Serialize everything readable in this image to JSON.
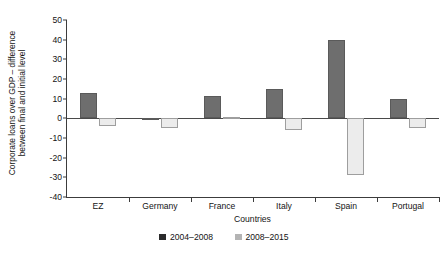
{
  "chart_data": {
    "type": "bar",
    "title": "",
    "subtitle": "",
    "xlabel": "Countries",
    "ylabel": "Corporate loans over GDP – difference between final and initial level",
    "ylabel_line1": "Corporate loans over GDP – difference",
    "ylabel_line2": "between final and initial level",
    "categories": [
      "EZ",
      "Germany",
      "France",
      "Italy",
      "Spain",
      "Portugal"
    ],
    "series": [
      {
        "name": "2004–2008",
        "color": "#6e6e6e",
        "legend_swatch_color": "#2b2b2b",
        "values": [
          13,
          -0.5,
          11.5,
          15,
          40,
          10
        ]
      },
      {
        "name": "2008–2015",
        "color": "#ececec",
        "legend_swatch_color": "#b4b4b4",
        "values": [
          -4,
          -5,
          0.5,
          -6,
          -29,
          -5
        ]
      }
    ],
    "ylim": [
      -40,
      50
    ],
    "yticks": [
      50,
      40,
      30,
      20,
      10,
      0,
      -10,
      -20,
      -30,
      -40
    ],
    "ytick_labels": [
      "50",
      "40",
      "30",
      "20",
      "10",
      "0",
      "-10",
      "-20",
      "-30",
      "-40"
    ],
    "grid": false,
    "legend_position": "bottom",
    "zero_line": true
  },
  "legend": {
    "entries": [
      {
        "label": "2004–2008"
      },
      {
        "label": "2008–2015"
      }
    ]
  }
}
